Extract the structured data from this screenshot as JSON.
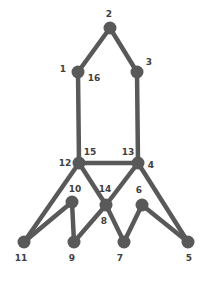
{
  "diagram": {
    "background_color": "#ffffff",
    "node_color": "#595959",
    "edge_color": "#595959",
    "label_color": "#404040",
    "node_radius": 6.5,
    "edge_width": 4.5,
    "width": 204,
    "height": 283
  },
  "nodes": [
    {
      "id": "n1",
      "label": "1",
      "x": 78,
      "y": 72,
      "label_x": 63,
      "label_y": 69
    },
    {
      "id": "n2",
      "label": "2",
      "x": 110,
      "y": 28,
      "label_x": 109,
      "label_y": 14
    },
    {
      "id": "n3",
      "label": "3",
      "x": 137,
      "y": 72,
      "label_x": 149,
      "label_y": 62
    },
    {
      "id": "n4",
      "label": "4",
      "x": 138,
      "y": 163,
      "label_x": 151,
      "label_y": 165
    },
    {
      "id": "n5",
      "label": "5",
      "x": 188,
      "y": 242,
      "label_x": 189,
      "label_y": 258
    },
    {
      "id": "n6",
      "label": "6",
      "x": 142,
      "y": 205,
      "label_x": 139,
      "label_y": 190
    },
    {
      "id": "n7",
      "label": "7",
      "x": 124,
      "y": 242,
      "label_x": 120,
      "label_y": 258
    },
    {
      "id": "n9",
      "label": "9",
      "x": 74,
      "y": 242,
      "label_x": 72,
      "label_y": 258
    },
    {
      "id": "n10",
      "label": "10",
      "x": 72,
      "y": 202,
      "label_x": 75,
      "label_y": 189
    },
    {
      "id": "n11",
      "label": "11",
      "x": 24,
      "y": 242,
      "label_x": 21,
      "label_y": 258
    },
    {
      "id": "n12",
      "label": "12",
      "x": 79,
      "y": 163,
      "label_x": 65,
      "label_y": 163
    },
    {
      "id": "n14",
      "label": "14",
      "x": 106,
      "y": 205,
      "label_x": 105,
      "label_y": 189
    }
  ],
  "edge_labels": [
    {
      "label": "16",
      "x": 94,
      "y": 78
    },
    {
      "label": "15",
      "x": 90,
      "y": 152
    },
    {
      "label": "13",
      "x": 128,
      "y": 152
    },
    {
      "label": "8",
      "x": 104,
      "y": 221
    }
  ],
  "edges": [
    {
      "id": "e-1-2",
      "from": "n1",
      "to": "n2",
      "label": ""
    },
    {
      "id": "e-2-3",
      "from": "n2",
      "to": "n3",
      "label": ""
    },
    {
      "id": "e-1-12",
      "from": "n1",
      "to": "n12",
      "label": "16"
    },
    {
      "id": "e-3-4",
      "from": "n3",
      "to": "n4",
      "label": ""
    },
    {
      "id": "e-12-4",
      "from": "n12",
      "to": "n4",
      "label": "15/13"
    },
    {
      "id": "e-12-11",
      "from": "n12",
      "to": "n11",
      "label": ""
    },
    {
      "id": "e-12-14",
      "from": "n12",
      "to": "n14",
      "label": ""
    },
    {
      "id": "e-10-11",
      "from": "n10",
      "to": "n11",
      "label": ""
    },
    {
      "id": "e-10-9",
      "from": "n10",
      "to": "n9",
      "label": ""
    },
    {
      "id": "e-9-14",
      "from": "n9",
      "to": "n14",
      "label": "8"
    },
    {
      "id": "e-14-7",
      "from": "n14",
      "to": "n7",
      "label": ""
    },
    {
      "id": "e-14-4",
      "from": "n14",
      "to": "n4",
      "label": ""
    },
    {
      "id": "e-4-5",
      "from": "n4",
      "to": "n5",
      "label": ""
    },
    {
      "id": "e-6-7",
      "from": "n6",
      "to": "n7",
      "label": ""
    },
    {
      "id": "e-6-5",
      "from": "n6",
      "to": "n5",
      "label": ""
    }
  ]
}
